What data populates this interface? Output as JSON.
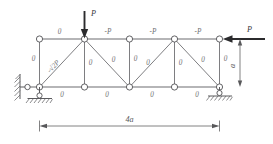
{
  "figure": {
    "kind": "statics-truss",
    "colors": {
      "background": "#ffffff",
      "member": "#6d6d70",
      "web": "#77777a",
      "node_fill": "#ffffff",
      "node_stroke": "#5a5a5d",
      "load": "#2b2b2d",
      "label": "#6e6e70",
      "dimension": "#58585a"
    }
  },
  "loads": [
    {
      "id": "load-top",
      "label": "P",
      "direction": "down",
      "applied_at": "top-node-2"
    },
    {
      "id": "load-right",
      "label": "P",
      "direction": "left",
      "applied_at": "top-node-5"
    }
  ],
  "dimensions": [
    {
      "id": "span",
      "label": "4a",
      "orientation": "horizontal"
    },
    {
      "id": "height",
      "label": "a",
      "orientation": "vertical"
    }
  ],
  "member_labels": {
    "top_chord": [
      "0",
      "-P",
      "-P",
      "-P"
    ],
    "bottom_chord": [
      "0",
      "0",
      "0",
      "0"
    ],
    "verticals": [
      "0",
      "0",
      "0",
      "0",
      "0"
    ],
    "diagonals": [
      "-√2P",
      "0",
      "0",
      "0"
    ]
  },
  "labels": {
    "top_1": "0",
    "top_2": "-P",
    "top_3": "-P",
    "top_4": "-P",
    "bot_1": "0",
    "bot_2": "0",
    "bot_3": "0",
    "bot_4": "0",
    "vert_1": "0",
    "vert_2": "0",
    "vert_3": "0",
    "vert_4": "0",
    "vert_5": "0",
    "diag_1": "-√2P",
    "diag_2": "0",
    "diag_3": "0",
    "diag_4": "0",
    "load_top": "P",
    "load_right": "P",
    "dim_span": "4a",
    "dim_height": "a"
  },
  "supports": [
    {
      "id": "left-support",
      "type": "pinned-link-with-roller"
    },
    {
      "id": "right-support",
      "type": "roller"
    }
  ]
}
